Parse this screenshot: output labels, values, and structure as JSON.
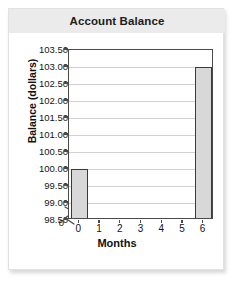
{
  "card": {
    "title": "Account Balance"
  },
  "chart_data": {
    "type": "bar",
    "title": "Account Balance",
    "xlabel": "Months",
    "ylabel": "Balance (dollars)",
    "categories": [
      "0",
      "1",
      "2",
      "3",
      "4",
      "5",
      "6"
    ],
    "values": [
      100.0,
      null,
      null,
      null,
      null,
      null,
      103.0
    ],
    "series": [
      {
        "name": "Balance",
        "values": [
          100.0,
          null,
          null,
          null,
          null,
          null,
          103.0
        ]
      }
    ],
    "ylim": [
      98.5,
      103.5
    ],
    "ytick_labels": [
      "103.50",
      "103.00",
      "102.50",
      "102.00",
      "101.50",
      "101.00",
      "100.50",
      "100.00",
      "99.50",
      "99.00",
      "98.50"
    ],
    "ytick_values": [
      103.5,
      103.0,
      102.5,
      102.0,
      101.5,
      101.0,
      100.5,
      100.0,
      99.5,
      99.0,
      98.5
    ],
    "y_axis_origin_label": "0",
    "y_axis_break": true,
    "xtick_labels": [
      "0",
      "1",
      "2",
      "3",
      "4",
      "5",
      "6"
    ],
    "xtick_values": [
      0,
      1,
      2,
      3,
      4,
      5,
      6
    ],
    "grid": true,
    "legend": false,
    "bar_fill_color": "#d8d8d8",
    "bar_border_color": "#3a3a3a",
    "gridline_color": "#d2d2d2",
    "axis_color": "#4a4a4a",
    "title_band_color": "#ebebeb",
    "plot_background": "#ffffff"
  }
}
